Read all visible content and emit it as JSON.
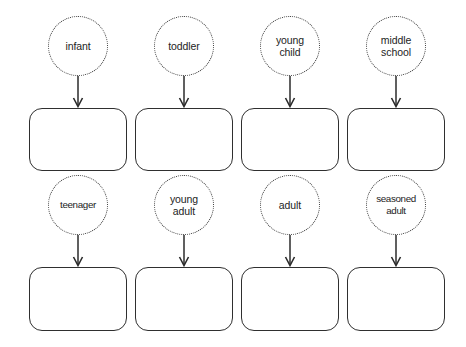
{
  "diagram": {
    "type": "flow-stages",
    "background_color": "#ffffff",
    "stroke_color": "#2f2f2f",
    "text_color": "#232323",
    "rows": [
      {
        "row_label": "row-1",
        "cells": [
          {
            "stage": "infant",
            "label": "infant",
            "box_text": ""
          },
          {
            "stage": "toddler",
            "label": "toddler",
            "box_text": ""
          },
          {
            "stage": "young-child",
            "label": "young\nchild",
            "box_text": ""
          },
          {
            "stage": "middle-school",
            "label": "middle\nschool",
            "box_text": ""
          }
        ]
      },
      {
        "row_label": "row-2",
        "cells": [
          {
            "stage": "teenager",
            "label": "teenager",
            "box_text": ""
          },
          {
            "stage": "young-adult",
            "label": "young\nadult",
            "box_text": ""
          },
          {
            "stage": "adult",
            "label": "adult",
            "box_text": ""
          },
          {
            "stage": "seasoned-adult",
            "label": "seasoned\nadult",
            "box_text": ""
          }
        ]
      }
    ]
  }
}
